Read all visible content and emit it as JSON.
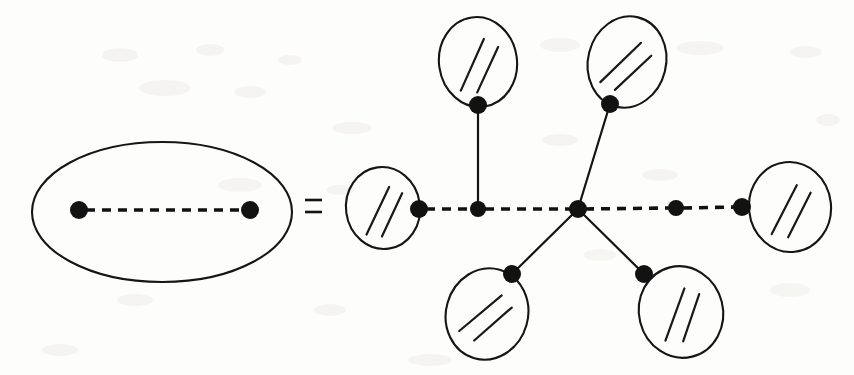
{
  "figure": {
    "background_color": "#fdfdfc",
    "ink_color": "#141414",
    "relation_symbol": "=",
    "relation_symbol_name": "equals-sign",
    "width": 854,
    "height": 375
  },
  "chart_data": {
    "type": "diagram",
    "notation": {
      "dashed_edge_meaning": "dashed edge",
      "hatched_blob_meaning": "hatched disk node",
      "solid_edge_meaning": "solid edge",
      "vertex_meaning": "filled vertex dot"
    },
    "left_side": {
      "label": "left-hand side",
      "enclosure": {
        "shape": "ellipse",
        "cx": 162,
        "cy": 212,
        "rx": 130,
        "ry": 70
      },
      "vertices": [
        {
          "id": "L1",
          "x": 79,
          "y": 210,
          "r": 9
        },
        {
          "id": "L2",
          "x": 250,
          "y": 210,
          "r": 9
        }
      ],
      "edges": [
        {
          "from": "L1",
          "to": "L2",
          "style": "dashed"
        }
      ]
    },
    "right_side": {
      "label": "right-hand side",
      "blobs": [
        {
          "id": "B1",
          "name": "blob-left",
          "cx": 383,
          "cy": 208,
          "rx": 37,
          "ry": 41,
          "rotation": -8
        },
        {
          "id": "B2",
          "name": "blob-top-left",
          "cx": 478,
          "cy": 62,
          "rx": 39,
          "ry": 45,
          "rotation": -8
        },
        {
          "id": "B3",
          "name": "blob-top-right",
          "cx": 627,
          "cy": 62,
          "rx": 39,
          "ry": 46,
          "rotation": 14
        },
        {
          "id": "B4",
          "name": "blob-bottom-left",
          "cx": 487,
          "cy": 314,
          "rx": 41,
          "ry": 46,
          "rotation": 16
        },
        {
          "id": "B5",
          "name": "blob-bottom-right",
          "cx": 681,
          "cy": 312,
          "rx": 42,
          "ry": 46,
          "rotation": -14
        },
        {
          "id": "B6",
          "name": "blob-right",
          "cx": 790,
          "cy": 207,
          "rx": 41,
          "ry": 45,
          "rotation": -6
        }
      ],
      "vertices": [
        {
          "id": "V1",
          "x": 419,
          "y": 209,
          "r": 9,
          "on_blob": "B1"
        },
        {
          "id": "V2",
          "x": 478,
          "y": 209,
          "r": 8
        },
        {
          "id": "V3",
          "x": 478,
          "y": 105,
          "r": 9,
          "on_blob": "B2"
        },
        {
          "id": "V4",
          "x": 610,
          "y": 104,
          "r": 9,
          "on_blob": "B3"
        },
        {
          "id": "V5",
          "x": 578,
          "y": 209,
          "r": 9
        },
        {
          "id": "V6",
          "x": 512,
          "y": 274,
          "r": 9,
          "on_blob": "B4"
        },
        {
          "id": "V7",
          "x": 644,
          "y": 274,
          "r": 9,
          "on_blob": "B5"
        },
        {
          "id": "V8",
          "x": 676,
          "y": 208,
          "r": 8
        },
        {
          "id": "V9",
          "x": 742,
          "y": 207,
          "r": 9,
          "on_blob": "B6"
        }
      ],
      "edges": [
        {
          "from": "V1",
          "to": "V2",
          "style": "dashed"
        },
        {
          "from": "V2",
          "to": "V5",
          "style": "dashed"
        },
        {
          "from": "V5",
          "to": "V8",
          "style": "dashed"
        },
        {
          "from": "V8",
          "to": "V9",
          "style": "dashed"
        },
        {
          "from": "V2",
          "to": "V3",
          "style": "solid"
        },
        {
          "from": "V5",
          "to": "V4",
          "style": "solid"
        },
        {
          "from": "V5",
          "to": "V6",
          "style": "solid"
        },
        {
          "from": "V5",
          "to": "V7",
          "style": "solid"
        }
      ]
    },
    "counts": {
      "left_vertices": 2,
      "left_dashed_edges": 1,
      "right_blobs": 6,
      "right_vertices": 9,
      "right_dashed_edges": 4,
      "right_solid_edges": 4
    }
  }
}
